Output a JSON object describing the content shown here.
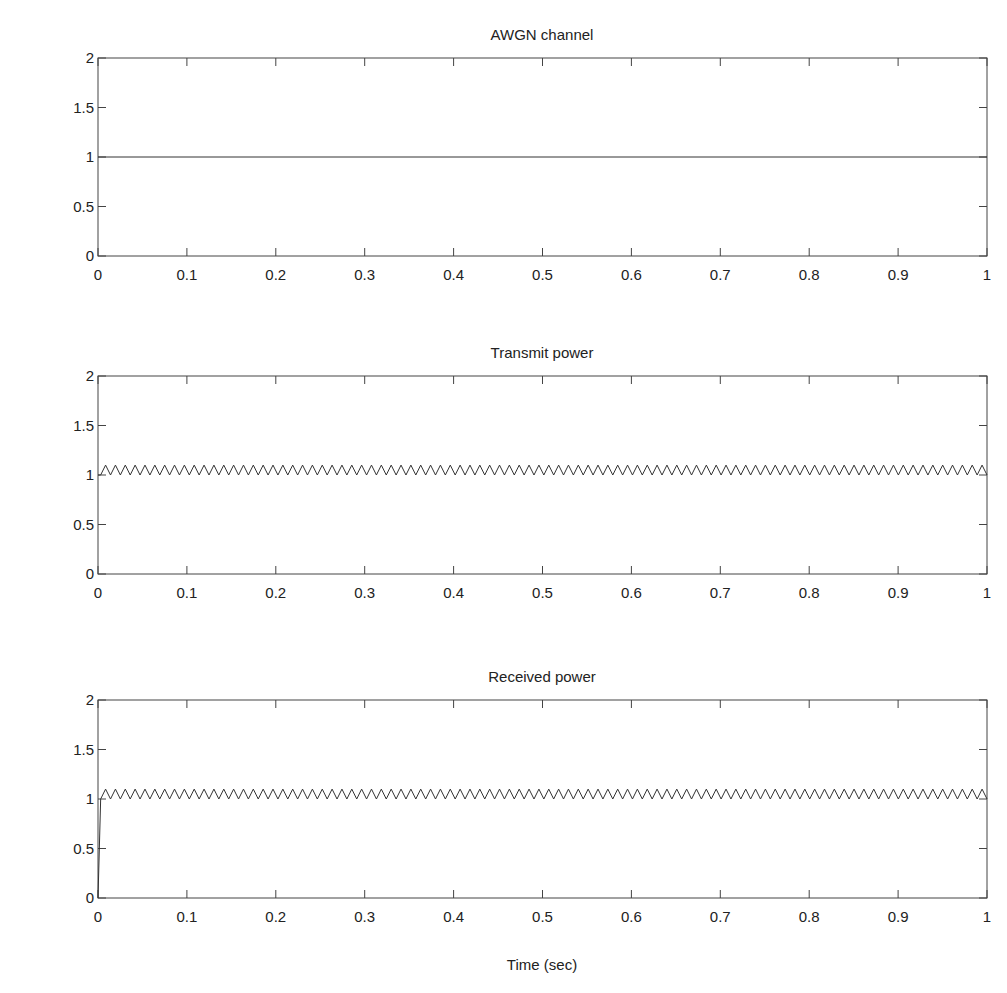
{
  "chart_data": [
    {
      "type": "line",
      "title": "AWGN channel",
      "xlabel": "",
      "ylabel": "",
      "xlim": [
        0,
        1
      ],
      "ylim": [
        0,
        2
      ],
      "xticks": [
        "0",
        "0.1",
        "0.2",
        "0.3",
        "0.4",
        "0.5",
        "0.6",
        "0.7",
        "0.8",
        "0.9",
        "1"
      ],
      "yticks": [
        "0",
        "0.5",
        "1",
        "1.5",
        "2"
      ],
      "grid": false,
      "series": [
        {
          "name": "channel gain",
          "kind": "constant",
          "value": 1.0,
          "x_start": 0,
          "x_end": 1
        }
      ]
    },
    {
      "type": "line",
      "title": "Transmit power",
      "xlabel": "",
      "ylabel": "",
      "xlim": [
        0,
        1
      ],
      "ylim": [
        0,
        2
      ],
      "xticks": [
        "0",
        "0.1",
        "0.2",
        "0.3",
        "0.4",
        "0.5",
        "0.6",
        "0.7",
        "0.8",
        "0.9",
        "1"
      ],
      "yticks": [
        "0",
        "0.5",
        "1",
        "1.5",
        "2"
      ],
      "grid": false,
      "series": [
        {
          "name": "transmit power",
          "kind": "oscillation",
          "min": 1.0,
          "max": 1.1,
          "cycles": 90,
          "x_start": 0.003,
          "x_end": 1,
          "initial_value": 1.0
        }
      ]
    },
    {
      "type": "line",
      "title": "Received power",
      "xlabel": "Time (sec)",
      "ylabel": "",
      "xlim": [
        0,
        1
      ],
      "ylim": [
        0,
        2
      ],
      "xticks": [
        "0",
        "0.1",
        "0.2",
        "0.3",
        "0.4",
        "0.5",
        "0.6",
        "0.7",
        "0.8",
        "0.9",
        "1"
      ],
      "yticks": [
        "0",
        "0.5",
        "1",
        "1.5",
        "2"
      ],
      "grid": false,
      "series": [
        {
          "name": "received power",
          "kind": "oscillation",
          "min": 1.0,
          "max": 1.1,
          "cycles": 90,
          "x_start": 0.003,
          "x_end": 1,
          "initial_value": 0.0
        }
      ]
    }
  ]
}
